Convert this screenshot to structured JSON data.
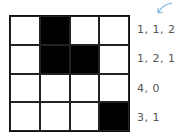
{
  "grid": {
    "rows": 4,
    "cols": 4,
    "cells": [
      [
        0,
        1,
        0,
        0
      ],
      [
        0,
        1,
        1,
        0
      ],
      [
        0,
        0,
        0,
        0
      ],
      [
        0,
        0,
        0,
        1
      ]
    ]
  },
  "row_labels": [
    "1, 1, 2",
    "1, 2, 1",
    "4, 0",
    "3, 1"
  ],
  "arrow": {
    "icon": "arrow-down-left-icon",
    "color": "#7fb8d6"
  }
}
